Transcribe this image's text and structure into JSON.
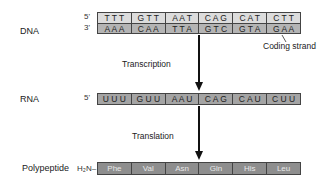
{
  "diagram": {
    "labels": {
      "dna": "DNA",
      "rna": "RNA",
      "polypeptide": "Polypeptide",
      "n_terminus": "H₂N–"
    },
    "ends": {
      "dna_top": "5'",
      "dna_bottom": "3'",
      "rna": "5'"
    },
    "dna_top_codons": [
      "T T T",
      "G T T",
      "A A T",
      "C A G",
      "C A T",
      "C T T"
    ],
    "dna_bottom_codons": [
      "A A A",
      "C A A",
      "T T A",
      "G T C",
      "G T A",
      "G A A"
    ],
    "rna_codons": [
      "U U U",
      "G U U",
      "A A U",
      "C A G",
      "C A U",
      "C U U"
    ],
    "amino_acids": [
      "Phe",
      "Val",
      "Asn",
      "Gln",
      "His",
      "Leu"
    ],
    "annotations": {
      "coding_strand": "Coding strand",
      "transcription": "Transcription",
      "translation": "Translation"
    },
    "colors": {
      "dna_top_fill": "#dcdcdc",
      "dna_bottom_fill": "#b4b4b4",
      "rna_fill": "#a4a4a4",
      "peptide_fill": "#8e8e8e"
    }
  }
}
